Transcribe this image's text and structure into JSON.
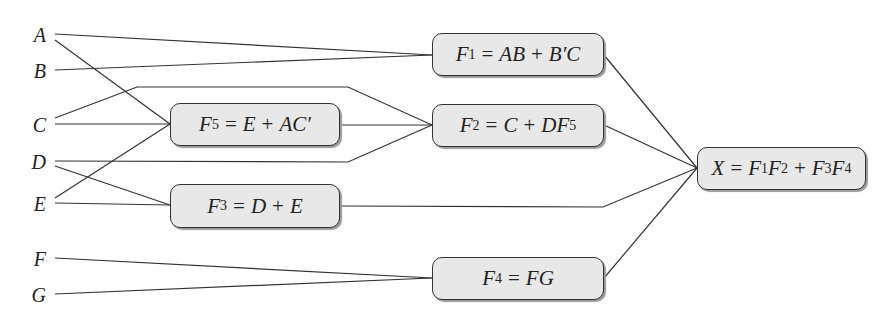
{
  "inputs": [
    {
      "id": "A",
      "label": "A",
      "x": 22,
      "y": 25
    },
    {
      "id": "B",
      "label": "B",
      "x": 22,
      "y": 61
    },
    {
      "id": "C",
      "label": "C",
      "x": 22,
      "y": 115
    },
    {
      "id": "D",
      "label": "D",
      "x": 22,
      "y": 152
    },
    {
      "id": "E",
      "label": "E",
      "x": 22,
      "y": 194
    },
    {
      "id": "F",
      "label": "F",
      "x": 22,
      "y": 249
    },
    {
      "id": "G",
      "label": "G",
      "x": 22,
      "y": 285
    }
  ],
  "nodes": {
    "F1": {
      "lhs": "F",
      "sub": "1",
      "eq": "=",
      "rhs_parts": [
        "AB",
        "+",
        "B′C"
      ],
      "x": 432,
      "y": 33,
      "w": 172,
      "h": 43
    },
    "F2": {
      "lhs": "F",
      "sub": "2",
      "eq": "=",
      "rhs_parts": [
        "C",
        "+",
        "DF"
      ],
      "rhs_sub": "5",
      "x": 432,
      "y": 104,
      "w": 172,
      "h": 43
    },
    "F5": {
      "lhs": "F",
      "sub": "5",
      "eq": "=",
      "rhs_parts": [
        "E",
        "+",
        "AC′"
      ],
      "x": 170,
      "y": 103,
      "w": 170,
      "h": 43
    },
    "F3": {
      "lhs": "F",
      "sub": "3",
      "eq": "=",
      "rhs_parts": [
        "D",
        "+",
        "E"
      ],
      "x": 170,
      "y": 184,
      "w": 170,
      "h": 44
    },
    "F4": {
      "lhs": "F",
      "sub": "4",
      "eq": "=",
      "rhs_parts": [
        "FG"
      ],
      "x": 432,
      "y": 257,
      "w": 172,
      "h": 43
    },
    "X": {
      "lhs": "X",
      "eq": "=",
      "terms": [
        "F",
        "1",
        "F",
        "2",
        "+",
        "F",
        "3",
        "F",
        "4"
      ],
      "x": 697,
      "y": 147,
      "w": 169,
      "h": 43
    }
  },
  "wires": [
    {
      "from": "A",
      "to": "F1",
      "points": "55,34 432,55"
    },
    {
      "from": "B",
      "to": "F1",
      "points": "55,70 432,55"
    },
    {
      "from": "A",
      "to": "F5",
      "points": "55,40 170,124"
    },
    {
      "from": "C",
      "to": "F2",
      "points": "55,118 137,87 348,87 432,125"
    },
    {
      "from": "C",
      "to": "F5",
      "points": "55,124 170,124"
    },
    {
      "from": "E",
      "to": "F5",
      "points": "55,198 170,124"
    },
    {
      "from": "F5",
      "to": "F2",
      "points": "340,125 432,125"
    },
    {
      "from": "D",
      "to": "F2",
      "points": "55,161 348,162 432,125"
    },
    {
      "from": "D",
      "to": "F3",
      "points": "55,166 170,205"
    },
    {
      "from": "E",
      "to": "F3",
      "points": "55,203 170,205"
    },
    {
      "from": "F",
      "to": "F4",
      "points": "55,258 432,278"
    },
    {
      "from": "G",
      "to": "F4",
      "points": "55,294 432,278"
    },
    {
      "from": "F1",
      "to": "X",
      "points": "604,55 697,168"
    },
    {
      "from": "F2",
      "to": "X",
      "points": "604,125 697,168"
    },
    {
      "from": "F3",
      "to": "X",
      "points": "340,206 603,207 697,168"
    },
    {
      "from": "F4",
      "to": "X",
      "points": "604,278 697,168"
    }
  ],
  "colors": {
    "wire": "#333333",
    "box_fill": "#e8e8e8",
    "box_border": "#333333",
    "shadow": "#9a9a9a"
  }
}
